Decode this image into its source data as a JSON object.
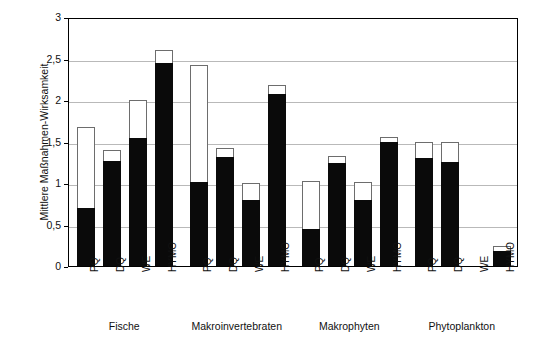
{
  "chart_data": {
    "type": "bar",
    "title": "",
    "subtitle": "",
    "xlabel": "",
    "ylabel": "Mittlere Maßnahmen-Wirksamkeit",
    "ylim": [
      0,
      3
    ],
    "ytick_labels": [
      "0",
      "0,5",
      "1",
      "1,5",
      "2",
      "2,5",
      "3"
    ],
    "ytick_values": [
      0,
      0.5,
      1,
      1.5,
      2,
      2.5,
      3
    ],
    "grid": true,
    "legend": [],
    "stacked": true,
    "groups": [
      "Fische",
      "Makroinvertebraten",
      "Makrophyten",
      "Phytoplankton"
    ],
    "categories": [
      "PQ",
      "DQ",
      "WE",
      "HYMO"
    ],
    "series": [
      {
        "name": "black-segment",
        "color": "#0a0a0a"
      },
      {
        "name": "white-segment",
        "color": "#ffffff"
      }
    ],
    "bars": [
      {
        "group": "Fische",
        "category": "PQ",
        "black": 0.7,
        "total": 1.67
      },
      {
        "group": "Fische",
        "category": "DQ",
        "black": 1.27,
        "total": 1.4
      },
      {
        "group": "Fische",
        "category": "WE",
        "black": 1.54,
        "total": 2.0
      },
      {
        "group": "Fische",
        "category": "HYMO",
        "black": 2.45,
        "total": 2.6
      },
      {
        "group": "Makroinvertebraten",
        "category": "PQ",
        "black": 1.01,
        "total": 2.42
      },
      {
        "group": "Makroinvertebraten",
        "category": "DQ",
        "black": 1.31,
        "total": 1.42
      },
      {
        "group": "Makroinvertebraten",
        "category": "WE",
        "black": 0.79,
        "total": 1.0
      },
      {
        "group": "Makroinvertebraten",
        "category": "HYMO",
        "black": 2.07,
        "total": 2.18
      },
      {
        "group": "Makrophyten",
        "category": "PQ",
        "black": 0.45,
        "total": 1.02
      },
      {
        "group": "Makrophyten",
        "category": "DQ",
        "black": 1.24,
        "total": 1.33
      },
      {
        "group": "Makrophyten",
        "category": "WE",
        "black": 0.79,
        "total": 1.01
      },
      {
        "group": "Makrophyten",
        "category": "HYMO",
        "black": 1.49,
        "total": 1.56
      },
      {
        "group": "Phytoplankton",
        "category": "PQ",
        "black": 1.3,
        "total": 1.5
      },
      {
        "group": "Phytoplankton",
        "category": "DQ",
        "black": 1.25,
        "total": 1.5
      },
      {
        "group": "Phytoplankton",
        "category": "WE",
        "black": 0.0,
        "total": 0.0
      },
      {
        "group": "Phytoplankton",
        "category": "HYMO",
        "black": 0.18,
        "total": 0.24
      }
    ]
  }
}
